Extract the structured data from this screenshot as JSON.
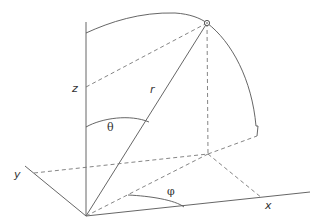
{
  "diagram": {
    "labels": {
      "z_axis": "z",
      "y_axis": "y",
      "x_axis": "x",
      "radius": "r",
      "polar_angle": "θ",
      "azimuth_angle": "φ"
    },
    "colors": {
      "line": "#555555",
      "dashed": "#777777",
      "text": "#333333"
    }
  }
}
